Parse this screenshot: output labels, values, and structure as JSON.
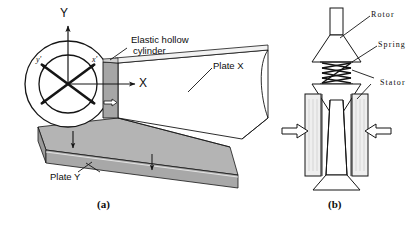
{
  "figure": {
    "panels": [
      {
        "id": "a",
        "caption": "(a)",
        "labels": {
          "elastic_cylinder": "Elastic hollow\ncylinder",
          "elastic_cylinder_line1": "Elastic hollow",
          "elastic_cylinder_line2": "cylinder",
          "plate_x": "Plate X",
          "plate_y": "Plate Y",
          "axis_X": "X",
          "axis_Y": "Y",
          "axis_x_prime": "x'",
          "axis_y_prime": "y'"
        }
      },
      {
        "id": "b",
        "caption": "(b)",
        "labels": {
          "rotor": "Rotor",
          "spring": "Spring",
          "stator": "Stator"
        }
      }
    ]
  },
  "colors": {
    "stroke": "#151515",
    "plate_grey": "#a6a6a6",
    "plate_grey_dark": "#8e8e8e",
    "plate_grey_light": "#c2c2c2",
    "stator_fill": "#efefef",
    "white": "#ffffff",
    "background": "#ffffff"
  }
}
